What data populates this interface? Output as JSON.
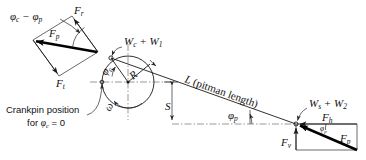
{
  "figure": {
    "background_color": "#ffffff",
    "line_color": "#1a1a1a",
    "width": 366,
    "height": 160
  },
  "labels": {
    "angle_difference": {
      "text": "φ",
      "sub1": "c",
      "minus": " − ",
      "text2": "φ",
      "sub2": "p",
      "full": "φc − φp"
    },
    "force_radial": {
      "symbol": "F",
      "sub": "r",
      "full": "Fr"
    },
    "force_pitman_left": {
      "symbol": "F",
      "sub": "p",
      "full": "Fp"
    },
    "force_tangential": {
      "symbol": "F",
      "sub": "t",
      "full": "Ft"
    },
    "crank_weight": {
      "symbol": "W",
      "sub": "c",
      "plus": " + ",
      "symbol2": "W",
      "sub2": "1",
      "full": "Wc + W1"
    },
    "crank_radius": {
      "symbol": "R",
      "full": "R"
    },
    "crank_angle": {
      "symbol": "φ",
      "sub": "c",
      "full": "φc"
    },
    "angular_velocity": {
      "symbol": "ω",
      "full": "ω"
    },
    "pitman_length": {
      "symbol": "L",
      "paren": " (pitman length)",
      "full": "L (pitman length)"
    },
    "offset_s": {
      "symbol": "S",
      "full": "S"
    },
    "pitman_angle": {
      "symbol": "φ",
      "sub": "p",
      "full": "φp"
    },
    "pitman_angle_small": {
      "symbol": "φ",
      "sub": "p",
      "full": "φp"
    },
    "slider_weight": {
      "symbol": "W",
      "sub": "s",
      "plus": " + ",
      "symbol2": "W",
      "sub2": "2",
      "full": "Ws + W2"
    },
    "force_horizontal": {
      "symbol": "F",
      "sub": "h",
      "full": "Fh"
    },
    "force_vertical": {
      "symbol": "F",
      "sub": "v",
      "full": "Fv"
    },
    "force_pitman_right": {
      "symbol": "F",
      "sub": "p",
      "full": "Fp"
    }
  },
  "annotations": {
    "crankpin_note_line1": "Crankpin position",
    "crankpin_note_line2_prefix": "for ",
    "crankpin_note_line2_symbol": "φ",
    "crankpin_note_line2_sub": "c",
    "crankpin_note_line2_suffix": " = 0",
    "crankpin_note_full": "Crankpin position for φc = 0"
  },
  "geometry": {
    "crank_center": {
      "x": 128,
      "y": 82
    },
    "crank_radius_px": 26,
    "crankpin": {
      "x": 111,
      "y": 58
    },
    "crosshead": {
      "x": 296,
      "y": 124
    },
    "phi_c_zero_point": {
      "x": 96,
      "y": 85
    }
  }
}
